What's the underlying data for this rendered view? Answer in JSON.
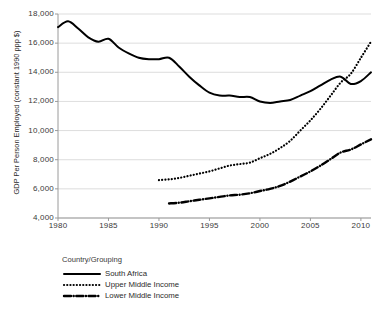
{
  "chart_data": {
    "type": "line",
    "title": "",
    "xlabel": "",
    "ylabel": "GDP Per Person Employed (constant 1990 ppp $)",
    "xlim": [
      1980,
      2011
    ],
    "ylim": [
      4000,
      18000
    ],
    "grid": true,
    "legend_position": "bottom-left",
    "legend_title": "Country/Grouping",
    "xticks": [
      1980,
      1985,
      1990,
      1995,
      2000,
      2005,
      2010
    ],
    "xtick_labels": [
      "1980",
      "1985",
      "1990",
      "1995",
      "2000",
      "2005",
      "2010"
    ],
    "yticks": [
      4000,
      6000,
      8000,
      10000,
      12000,
      14000,
      16000,
      18000
    ],
    "ytick_labels": [
      "4,000",
      "6,000",
      "8,000",
      "10,000",
      "12,000",
      "14,000",
      "16,000",
      "18,000"
    ],
    "series": [
      {
        "name": "South Africa",
        "style": "solid",
        "color": "#000000",
        "x": [
          1980,
          1981,
          1982,
          1983,
          1984,
          1985,
          1986,
          1987,
          1988,
          1989,
          1990,
          1991,
          1992,
          1993,
          1994,
          1995,
          1996,
          1997,
          1998,
          1999,
          2000,
          2001,
          2002,
          2003,
          2004,
          2005,
          2006,
          2007,
          2008,
          2009,
          2010,
          2011
        ],
        "values": [
          17100,
          17500,
          17000,
          16400,
          16100,
          16300,
          15700,
          15300,
          15000,
          14900,
          14900,
          15000,
          14400,
          13700,
          13100,
          12600,
          12400,
          12400,
          12300,
          12300,
          12000,
          11900,
          12000,
          12100,
          12400,
          12700,
          13100,
          13500,
          13700,
          13200,
          13400,
          14000
        ]
      },
      {
        "name": "Upper Middle Income",
        "style": "dotted",
        "color": "#000000",
        "x": [
          1990,
          1991,
          1992,
          1993,
          1994,
          1995,
          1996,
          1997,
          1998,
          1999,
          2000,
          2001,
          2002,
          2003,
          2004,
          2005,
          2006,
          2007,
          2008,
          2009,
          2010,
          2011
        ],
        "values": [
          6600,
          6650,
          6750,
          6900,
          7050,
          7200,
          7400,
          7600,
          7700,
          7800,
          8100,
          8400,
          8800,
          9300,
          10000,
          10700,
          11500,
          12400,
          13300,
          13900,
          15000,
          16100
        ]
      },
      {
        "name": "Lower Middle Income",
        "style": "dashdot",
        "color": "#000000",
        "x": [
          1991,
          1992,
          1993,
          1994,
          1995,
          1996,
          1997,
          1998,
          1999,
          2000,
          2001,
          2002,
          2003,
          2004,
          2005,
          2006,
          2007,
          2008,
          2009,
          2010,
          2011
        ],
        "values": [
          5000,
          5050,
          5150,
          5250,
          5350,
          5450,
          5550,
          5600,
          5700,
          5850,
          6000,
          6200,
          6500,
          6850,
          7200,
          7600,
          8050,
          8500,
          8700,
          9050,
          9400
        ]
      }
    ]
  }
}
